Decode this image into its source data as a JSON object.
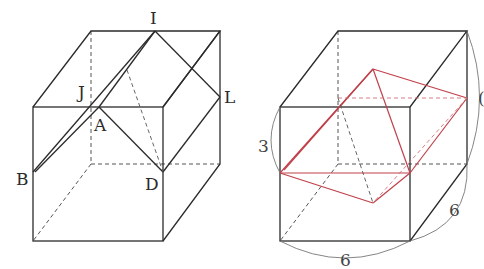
{
  "figures": [
    {
      "id": "left-cube",
      "description": "Cube with vertices labeled and cut lines",
      "labels": {
        "I": "I",
        "J": "J",
        "L": "L",
        "A": "A",
        "B": "B",
        "D": "D"
      }
    },
    {
      "id": "right-cube",
      "description": "Cube with red cross-section polyhedron",
      "dimensions": {
        "height_part": "3",
        "width": "6",
        "depth": "6",
        "right_partial": "("
      },
      "colors": {
        "edge": "#2b2b2b",
        "section": "#c0404a"
      }
    }
  ]
}
